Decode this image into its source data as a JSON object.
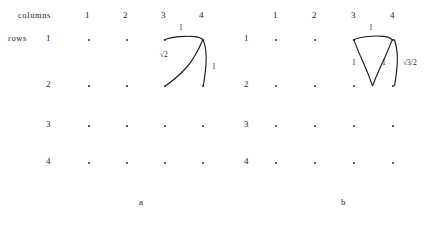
{
  "figure": {
    "caption_a": "a",
    "caption_b": "b",
    "axis_labels": {
      "columns": "columns",
      "rows": "rows"
    },
    "column_headers": [
      "1",
      "2",
      "3",
      "4"
    ],
    "row_headers": [
      "1",
      "2",
      "3",
      "4"
    ],
    "panel_a": {
      "caption": "a",
      "shape": "right-triangle-on-lattice",
      "measurements": {
        "top_side": "1",
        "hypotenuse": "√2",
        "right_side": "1"
      }
    },
    "panel_b": {
      "caption": "b",
      "shape": "equilateral-triangle-on-lattice",
      "measurements": {
        "top_side": "1",
        "left_side": "1",
        "right_side": "1",
        "height": "√3/2"
      }
    }
  }
}
